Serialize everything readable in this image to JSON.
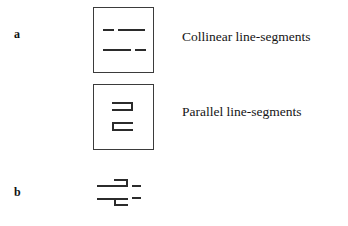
{
  "figure": {
    "panels": [
      {
        "id": "a",
        "label": "a"
      },
      {
        "id": "b",
        "label": "b"
      }
    ],
    "captions": {
      "collinear": "Collinear line-segments",
      "parallel": "Parallel line-segments"
    },
    "colors": {
      "background": "#ffffff",
      "stroke": "#2b2b2b",
      "box_border": "#3b3b3b",
      "text": "#151515"
    },
    "panel_a": {
      "boxes": [
        {
          "name": "collinear-box",
          "caption_key": "collinear",
          "stimulus": "two horizontal rows, each made of a short dash and a long dash that are collinear (aligned on the same horizontal axis)",
          "rows": [
            {
              "row": "top",
              "segments": [
                {
                  "kind": "short-dash",
                  "side": "left"
                },
                {
                  "kind": "long-dash",
                  "side": "right"
                }
              ]
            },
            {
              "row": "bottom",
              "segments": [
                {
                  "kind": "long-dash",
                  "side": "left"
                },
                {
                  "kind": "short-dash",
                  "side": "right"
                }
              ]
            }
          ]
        },
        {
          "name": "parallel-box",
          "caption_key": "parallel",
          "stimulus": "two bracket shapes; upper opens left (like a right bracket) and lower opens right (like a left bracket)",
          "shapes": [
            {
              "shape": "right-bracket",
              "glyph": "⊐",
              "position": "upper"
            },
            {
              "shape": "left-bracket",
              "glyph": "⊏",
              "position": "lower"
            }
          ]
        }
      ]
    },
    "panel_b": {
      "name": "combined-stimulus",
      "stimulus": "collinear dashes superimposed with bracket shapes, two stacked rows",
      "rows": [
        {
          "row": "top",
          "elements": [
            "long-dash-left",
            "right-bracket",
            "short-dash-right"
          ]
        },
        {
          "row": "bottom",
          "elements": [
            "long-dash-left",
            "left-bracket",
            "short-dash-right"
          ]
        }
      ]
    }
  }
}
